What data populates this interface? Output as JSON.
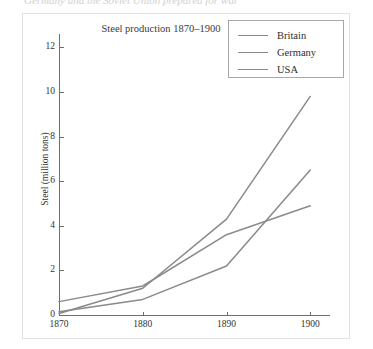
{
  "top_caption": "Germany and the Soviet Union prepared for war",
  "figure": {
    "legend": {
      "entries": [
        {
          "label": "Britain",
          "color": "#8a8a8a"
        },
        {
          "label": "Germany",
          "color": "#8a8a8a"
        },
        {
          "label": "USA",
          "color": "#8a8a8a"
        }
      ]
    }
  },
  "chart_data": {
    "type": "line",
    "title": "Steel production 1870–1900",
    "xlabel": "",
    "ylabel": "Steel (million tons)",
    "x": [
      1870,
      1880,
      1890,
      1900
    ],
    "xtick_labels": [
      "1870",
      "1880",
      "1890",
      "1900"
    ],
    "ytick_labels": [
      "0",
      "2",
      "4",
      "6",
      "8",
      "10",
      "12"
    ],
    "yticks": [
      0,
      2,
      4,
      6,
      8,
      10,
      12
    ],
    "xlim": [
      1870,
      1902
    ],
    "ylim": [
      0,
      12.6
    ],
    "grid": false,
    "legend_position": "top-right",
    "series": [
      {
        "name": "Britain",
        "color": "#8a8a8a",
        "values": [
          0.6,
          1.3,
          3.6,
          4.9
        ]
      },
      {
        "name": "Germany",
        "color": "#8a8a8a",
        "values": [
          0.15,
          0.7,
          2.2,
          6.5
        ]
      },
      {
        "name": "USA",
        "color": "#8a8a8a",
        "values": [
          0.07,
          1.2,
          4.3,
          9.8
        ]
      }
    ]
  }
}
